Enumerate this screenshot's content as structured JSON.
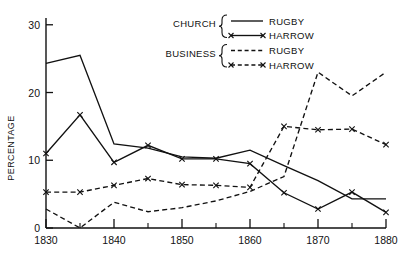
{
  "chart_data": {
    "type": "line",
    "title": "",
    "xlabel": "",
    "ylabel": "PERCENTAGE",
    "xlim": [
      1830,
      1880
    ],
    "ylim": [
      0,
      31
    ],
    "grid": false,
    "legend_position": "top-right",
    "x_ticks": [
      "1830",
      "1840",
      "1850",
      "1860",
      "1870",
      "1880"
    ],
    "x_tick_values": [
      1830,
      1840,
      1850,
      1860,
      1870,
      1880
    ],
    "x_minor_ticks": [
      1835,
      1845,
      1855,
      1865,
      1875
    ],
    "y_ticks": [
      "0",
      "10",
      "20",
      "30"
    ],
    "y_tick_values": [
      0,
      10,
      20,
      30
    ],
    "x": [
      1830,
      1835,
      1840,
      1845,
      1850,
      1855,
      1860,
      1865,
      1870,
      1875,
      1880
    ],
    "series": [
      {
        "name": "CHURCH RUGBY",
        "group": "CHURCH",
        "school": "RUGBY",
        "style": "solid",
        "marker": "none",
        "color": "#111111",
        "values": [
          24.3,
          25.5,
          12.4,
          11.8,
          10.5,
          10.3,
          11.5,
          9.2,
          7.0,
          4.3,
          4.3
        ]
      },
      {
        "name": "CHURCH HARROW",
        "group": "CHURCH",
        "school": "HARROW",
        "style": "solid",
        "marker": "x",
        "color": "#111111",
        "values": [
          11.0,
          16.7,
          9.7,
          12.2,
          10.2,
          10.2,
          9.5,
          5.2,
          2.8,
          5.3,
          2.3
        ]
      },
      {
        "name": "BUSINESS RUGBY",
        "group": "BUSINESS",
        "school": "RUGBY",
        "style": "dashed",
        "marker": "none",
        "color": "#111111",
        "values": [
          2.8,
          0.0,
          3.8,
          2.4,
          3.0,
          4.0,
          5.4,
          7.6,
          23.0,
          19.5,
          23.0
        ]
      },
      {
        "name": "BUSINESS HARROW",
        "group": "BUSINESS",
        "school": "HARROW",
        "style": "dashed",
        "marker": "x",
        "color": "#111111",
        "values": [
          5.3,
          5.3,
          6.3,
          7.3,
          6.4,
          6.3,
          6.0,
          15.0,
          14.5,
          14.6,
          12.3
        ]
      }
    ]
  },
  "legend": {
    "groups": [
      {
        "label": "CHURCH",
        "entries": [
          {
            "label": "RUGBY",
            "style": "solid",
            "marker": "none"
          },
          {
            "label": "HARROW",
            "style": "solid",
            "marker": "x"
          }
        ]
      },
      {
        "label": "BUSINESS",
        "entries": [
          {
            "label": "RUGBY",
            "style": "dashed",
            "marker": "none"
          },
          {
            "label": "HARROW",
            "style": "dashed",
            "marker": "x"
          }
        ]
      }
    ]
  }
}
